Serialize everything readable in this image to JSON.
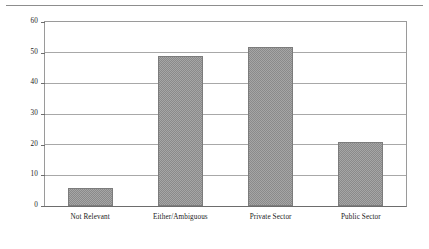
{
  "chart_data": {
    "type": "bar",
    "title": "",
    "subtitle": "",
    "xlabel": "",
    "ylabel": "",
    "categories": [
      "Not Relevant",
      "Either/Ambiguous",
      "Private Sector",
      "Public Sector"
    ],
    "values": [
      6,
      49,
      52,
      21
    ],
    "ylim": [
      0,
      60
    ],
    "yticks": [
      0,
      10,
      20,
      30,
      40,
      50,
      60
    ],
    "ytick_labels": [
      "0",
      "10",
      "20",
      "30",
      "40",
      "50",
      "60"
    ],
    "grid": true,
    "grid_axis": "y",
    "legend": false,
    "legend_position": "none",
    "bar_fill": "#a6a6a6",
    "bar_hatch": "checkerboard",
    "bar_edge_color": "#7c7c7c",
    "axis_color": "#6d6d6d",
    "grid_color": "#a8a8a8",
    "background_color": "#ffffff",
    "text_color": "#1a1a1a"
  },
  "figure": {
    "top_rule_color": "#8d8d8d"
  }
}
